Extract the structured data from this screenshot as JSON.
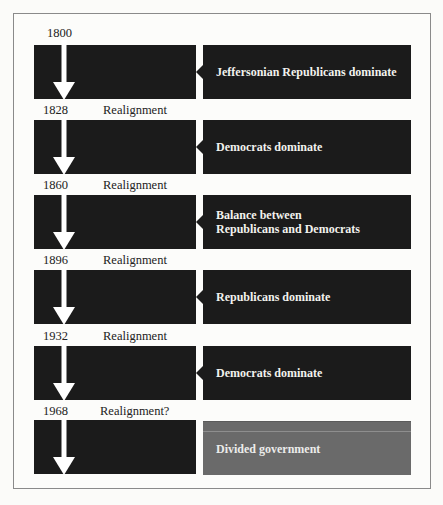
{
  "diagram": {
    "colors": {
      "block": "#1b1b1b",
      "block_last": "#6a6a6a",
      "arrow": "#ffffff",
      "text_on_block": "#f2f2ee",
      "label_text": "#222222",
      "frame_border": "#8a8a8a"
    },
    "eras": [
      {
        "year": "1800",
        "label": "",
        "description": "Jeffersonian Republicans dominate"
      },
      {
        "year": "1828",
        "label": "Realignment",
        "description": "Democrats dominate"
      },
      {
        "year": "1860",
        "label": "Realignment",
        "description": "Balance between Republicans and Democrats"
      },
      {
        "year": "1896",
        "label": "Realignment",
        "description": "Republicans dominate"
      },
      {
        "year": "1932",
        "label": "Realignment",
        "description": "Democrats dominate"
      },
      {
        "year": "1968",
        "label": "Realignment?",
        "description": "Divided government"
      }
    ]
  }
}
